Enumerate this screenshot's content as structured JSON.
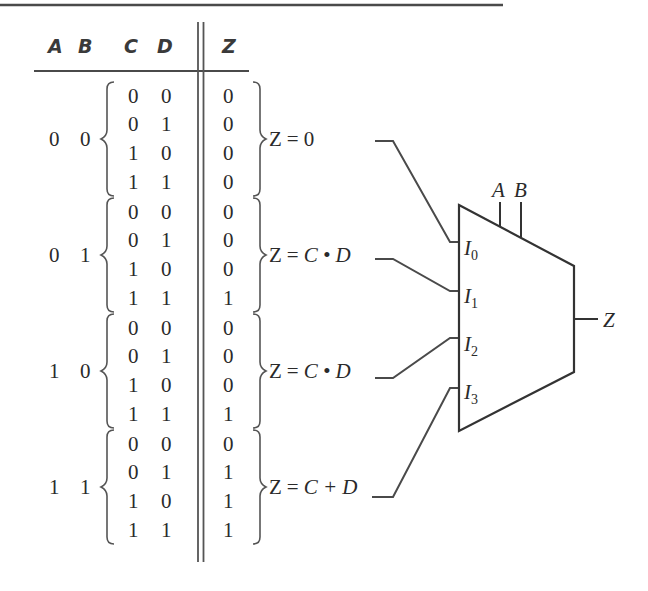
{
  "header": {
    "columns": [
      "A",
      "B",
      "C",
      "D",
      "Z"
    ]
  },
  "groups": [
    {
      "ab": [
        "0",
        "0"
      ],
      "rows": [
        [
          "0",
          "0",
          "0"
        ],
        [
          "0",
          "1",
          "0"
        ],
        [
          "1",
          "0",
          "0"
        ],
        [
          "1",
          "1",
          "0"
        ]
      ],
      "equation": {
        "lhs": "Z",
        "op": "=",
        "rhs": "0"
      },
      "mux_input": "I0"
    },
    {
      "ab": [
        "0",
        "1"
      ],
      "rows": [
        [
          "0",
          "0",
          "0"
        ],
        [
          "0",
          "1",
          "0"
        ],
        [
          "1",
          "0",
          "0"
        ],
        [
          "1",
          "1",
          "1"
        ]
      ],
      "equation": {
        "lhs": "Z",
        "op": "=",
        "rhs": "C • D"
      },
      "mux_input": "I1"
    },
    {
      "ab": [
        "1",
        "0"
      ],
      "rows": [
        [
          "0",
          "0",
          "0"
        ],
        [
          "0",
          "1",
          "0"
        ],
        [
          "1",
          "0",
          "0"
        ],
        [
          "1",
          "1",
          "1"
        ]
      ],
      "equation": {
        "lhs": "Z",
        "op": "=",
        "rhs": "C • D"
      },
      "mux_input": "I2"
    },
    {
      "ab": [
        "1",
        "1"
      ],
      "rows": [
        [
          "0",
          "0",
          "0"
        ],
        [
          "0",
          "1",
          "1"
        ],
        [
          "1",
          "0",
          "1"
        ],
        [
          "1",
          "1",
          "1"
        ]
      ],
      "equation": {
        "lhs": "Z",
        "op": "=",
        "rhs": "C + D"
      },
      "mux_input": "I3"
    }
  ],
  "mux": {
    "inputs": [
      {
        "letter": "I",
        "sub": "0"
      },
      {
        "letter": "I",
        "sub": "1"
      },
      {
        "letter": "I",
        "sub": "2"
      },
      {
        "letter": "I",
        "sub": "3"
      }
    ],
    "selects": [
      "A",
      "B"
    ],
    "output": "Z"
  },
  "colors": {
    "ink": "#2a2a2a",
    "line": "#4a4a4a",
    "background": "#ffffff"
  }
}
